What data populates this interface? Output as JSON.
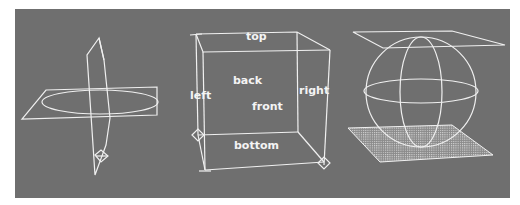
{
  "figure": {
    "background_color": "#6f6f6f",
    "line_color": "#f2f2f2",
    "panels": [
      {
        "name": "intersecting-planes",
        "description": "vertical plane intersecting horizontal plane with ellipse"
      },
      {
        "name": "labeled-cube",
        "labels": {
          "top": "top",
          "back": "back",
          "left": "left",
          "front": "front",
          "right": "right",
          "bottom": "bottom"
        }
      },
      {
        "name": "sphere-between-planes",
        "description": "wireframe sphere between top plane and gridded bottom plane"
      }
    ]
  }
}
